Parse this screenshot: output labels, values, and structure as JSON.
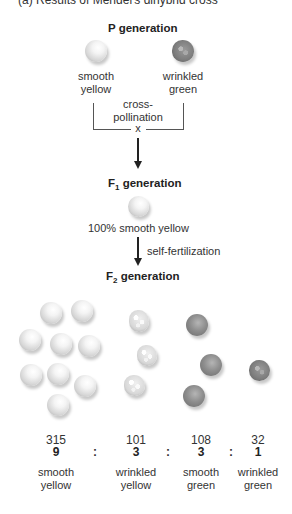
{
  "title": "(a) Results of Mendel's dihybrid cross",
  "p_generation": {
    "heading": "P generation",
    "parents": [
      {
        "label_line1": "smooth",
        "label_line2": "yellow",
        "phenotype": "smooth-yellow"
      },
      {
        "label_line1": "wrinkled",
        "label_line2": "green",
        "phenotype": "wrinkled-green"
      }
    ],
    "cross_label_line1": "cross-",
    "cross_label_line2": "pollination",
    "cross_symbol": "x"
  },
  "f1_generation": {
    "heading_prefix": "F",
    "heading_sub": "1",
    "heading_suffix": " generation",
    "result": "100% smooth yellow",
    "process": "self-fertilization"
  },
  "f2_generation": {
    "heading_prefix": "F",
    "heading_sub": "2",
    "heading_suffix": " generation",
    "ratio_separator": ":",
    "groups": [
      {
        "count": "315",
        "ratio": "9",
        "label_line1": "smooth",
        "label_line2": "yellow",
        "phenotype": "smooth-yellow"
      },
      {
        "count": "101",
        "ratio": "3",
        "label_line1": "wrinkled",
        "label_line2": "yellow",
        "phenotype": "wrinkled-yellow"
      },
      {
        "count": "108",
        "ratio": "3",
        "label_line1": "smooth",
        "label_line2": "green",
        "phenotype": "smooth-green"
      },
      {
        "count": "32",
        "ratio": "1",
        "label_line1": "wrinkled",
        "label_line2": "green",
        "phenotype": "wrinkled-green"
      }
    ]
  }
}
